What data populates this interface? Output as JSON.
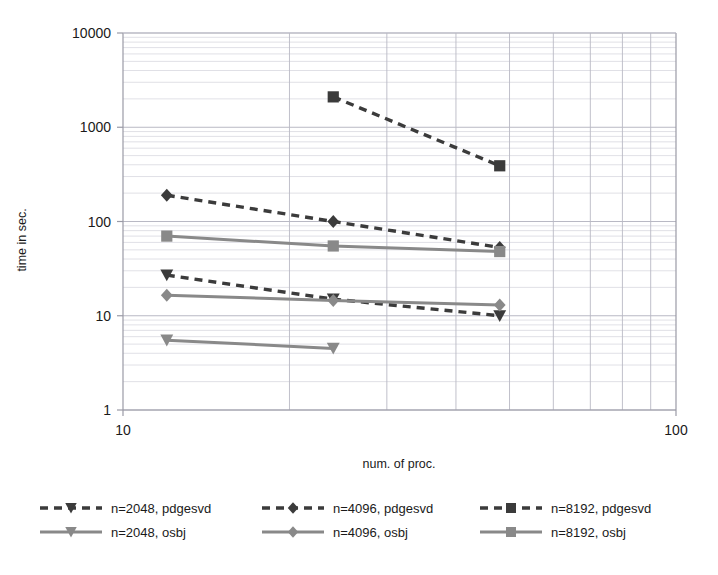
{
  "chart_data": {
    "type": "line",
    "title": "",
    "xlabel": "num. of proc.",
    "ylabel": "time in sec.",
    "xscale": "log",
    "yscale": "log",
    "xlim": [
      10,
      100
    ],
    "ylim": [
      1,
      10000
    ],
    "grid": true,
    "legend_position": "bottom",
    "xticks": [
      "10",
      "100"
    ],
    "xtick_values": [
      10,
      100
    ],
    "yticks": [
      "1",
      "10",
      "100",
      "1000",
      "10000"
    ],
    "ytick_values": [
      1,
      10,
      100,
      1000,
      10000
    ],
    "x": [
      12,
      24,
      48
    ],
    "series": [
      {
        "name": "n=2048, pdgesvd",
        "style": "dashed",
        "marker": "triangle-down",
        "color": "#3b3b3b",
        "x": [
          12,
          24,
          48
        ],
        "values": [
          27,
          15,
          10
        ]
      },
      {
        "name": "n=4096, pdgesvd",
        "style": "dashed",
        "marker": "diamond",
        "color": "#3b3b3b",
        "x": [
          12,
          24,
          48
        ],
        "values": [
          190,
          100,
          53
        ]
      },
      {
        "name": "n=8192, pdgesvd",
        "style": "dashed",
        "marker": "square",
        "color": "#3b3b3b",
        "x": [
          24,
          48
        ],
        "values": [
          2100,
          390
        ]
      },
      {
        "name": "n=2048, osbj",
        "style": "solid",
        "marker": "triangle-down",
        "color": "#898989",
        "x": [
          12,
          24
        ],
        "values": [
          5.5,
          4.5
        ]
      },
      {
        "name": "n=4096, osbj",
        "style": "solid",
        "marker": "diamond",
        "color": "#898989",
        "x": [
          12,
          24,
          48
        ],
        "values": [
          16.5,
          14.5,
          13
        ]
      },
      {
        "name": "n=8192, osbj",
        "style": "solid",
        "marker": "square",
        "color": "#898989",
        "x": [
          12,
          24,
          48
        ],
        "values": [
          70,
          55,
          48
        ]
      }
    ]
  },
  "legend": {
    "entries": [
      {
        "label": "n=2048, pdgesvd"
      },
      {
        "label": "n=4096, pdgesvd"
      },
      {
        "label": "n=8192, pdgesvd"
      },
      {
        "label": "n=2048, osbj"
      },
      {
        "label": "n=4096, osbj"
      },
      {
        "label": "n=8192, osbj"
      }
    ]
  },
  "colors": {
    "dashed_series": "#3b3b3b",
    "solid_series": "#898989",
    "grid_major": "#b9b9c4",
    "grid_minor": "#d8d8e0",
    "axis": "#9a9aa6",
    "text": "#1a1a1a",
    "background": "#ffffff"
  }
}
